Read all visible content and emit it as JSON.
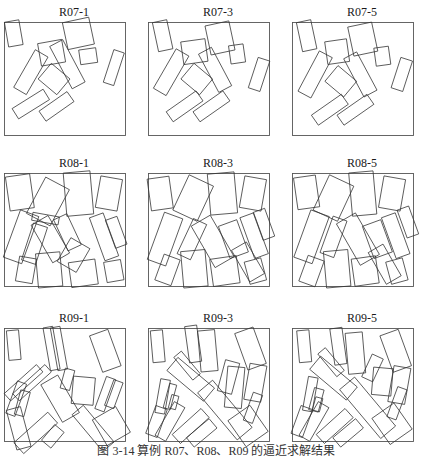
{
  "caption": "图 3-14   算例 R07、R08、R09 的逼近求解结果",
  "panels": [
    {
      "title": "R07-1",
      "pieces": [
        [
          0.08,
          0.1,
          0.12,
          0.22,
          -10
        ],
        [
          0.61,
          0.1,
          0.22,
          0.24,
          -12
        ],
        [
          0.39,
          0.27,
          0.2,
          0.2,
          -10
        ],
        [
          0.69,
          0.3,
          0.14,
          0.13,
          -8
        ],
        [
          0.52,
          0.37,
          0.12,
          0.42,
          -28
        ],
        [
          0.22,
          0.44,
          0.12,
          0.38,
          30
        ],
        [
          0.41,
          0.5,
          0.2,
          0.18,
          40
        ],
        [
          0.9,
          0.4,
          0.09,
          0.3,
          18
        ],
        [
          0.22,
          0.72,
          0.1,
          0.32,
          58
        ],
        [
          0.43,
          0.74,
          0.1,
          0.3,
          55
        ]
      ]
    },
    {
      "title": "R07-3",
      "pieces": [
        [
          0.12,
          0.12,
          0.12,
          0.26,
          -12
        ],
        [
          0.59,
          0.14,
          0.2,
          0.26,
          -12
        ],
        [
          0.38,
          0.26,
          0.2,
          0.2,
          -8
        ],
        [
          0.73,
          0.28,
          0.12,
          0.16,
          -8
        ],
        [
          0.19,
          0.44,
          0.12,
          0.4,
          30
        ],
        [
          0.55,
          0.42,
          0.12,
          0.38,
          -28
        ],
        [
          0.4,
          0.5,
          0.2,
          0.18,
          40
        ],
        [
          0.91,
          0.46,
          0.1,
          0.28,
          18
        ],
        [
          0.3,
          0.74,
          0.1,
          0.32,
          55
        ],
        [
          0.52,
          0.74,
          0.1,
          0.32,
          55
        ]
      ]
    },
    {
      "title": "R07-5",
      "pieces": [
        [
          0.12,
          0.12,
          0.12,
          0.26,
          -12
        ],
        [
          0.58,
          0.15,
          0.2,
          0.26,
          -12
        ],
        [
          0.37,
          0.26,
          0.18,
          0.2,
          -8
        ],
        [
          0.74,
          0.3,
          0.12,
          0.16,
          -8
        ],
        [
          0.19,
          0.46,
          0.12,
          0.4,
          28
        ],
        [
          0.56,
          0.46,
          0.12,
          0.38,
          -28
        ],
        [
          0.4,
          0.52,
          0.2,
          0.18,
          40
        ],
        [
          0.9,
          0.46,
          0.1,
          0.28,
          18
        ],
        [
          0.31,
          0.77,
          0.1,
          0.32,
          55
        ],
        [
          0.52,
          0.77,
          0.1,
          0.32,
          55
        ]
      ]
    },
    {
      "title": "R08-1",
      "pieces": [
        [
          0.13,
          0.17,
          0.2,
          0.3,
          -8
        ],
        [
          0.36,
          0.25,
          0.22,
          0.36,
          28
        ],
        [
          0.61,
          0.18,
          0.22,
          0.38,
          -5
        ],
        [
          0.86,
          0.18,
          0.18,
          0.28,
          10
        ],
        [
          0.14,
          0.56,
          0.16,
          0.44,
          20
        ],
        [
          0.25,
          0.62,
          0.12,
          0.34,
          18
        ],
        [
          0.38,
          0.58,
          0.16,
          0.38,
          -30
        ],
        [
          0.52,
          0.52,
          0.12,
          0.3,
          -25
        ],
        [
          0.57,
          0.72,
          0.18,
          0.24,
          30
        ],
        [
          0.82,
          0.56,
          0.12,
          0.4,
          -20
        ],
        [
          0.92,
          0.52,
          0.1,
          0.26,
          -20
        ],
        [
          0.18,
          0.85,
          0.14,
          0.22,
          10
        ],
        [
          0.37,
          0.85,
          0.2,
          0.3,
          -5
        ],
        [
          0.65,
          0.88,
          0.22,
          0.22,
          -8
        ],
        [
          0.9,
          0.86,
          0.14,
          0.18,
          -10
        ],
        [
          0.34,
          0.4,
          0.22,
          0.07,
          10
        ]
      ]
    },
    {
      "title": "R08-3",
      "pieces": [
        [
          0.1,
          0.18,
          0.18,
          0.28,
          -8
        ],
        [
          0.37,
          0.22,
          0.22,
          0.34,
          25
        ],
        [
          0.61,
          0.18,
          0.22,
          0.36,
          -5
        ],
        [
          0.86,
          0.18,
          0.18,
          0.28,
          10
        ],
        [
          0.14,
          0.58,
          0.16,
          0.44,
          20
        ],
        [
          0.36,
          0.58,
          0.12,
          0.34,
          25
        ],
        [
          0.53,
          0.6,
          0.18,
          0.42,
          -30
        ],
        [
          0.7,
          0.58,
          0.16,
          0.3,
          -20
        ],
        [
          0.87,
          0.55,
          0.12,
          0.38,
          -20
        ],
        [
          0.95,
          0.45,
          0.1,
          0.26,
          -20
        ],
        [
          0.16,
          0.85,
          0.14,
          0.24,
          20
        ],
        [
          0.38,
          0.84,
          0.2,
          0.32,
          -5
        ],
        [
          0.63,
          0.86,
          0.22,
          0.24,
          -8
        ],
        [
          0.88,
          0.86,
          0.14,
          0.2,
          -15
        ],
        [
          0.82,
          0.78,
          0.14,
          0.32,
          -30
        ]
      ]
    },
    {
      "title": "R08-5",
      "pieces": [
        [
          0.12,
          0.17,
          0.18,
          0.28,
          -8
        ],
        [
          0.34,
          0.22,
          0.22,
          0.34,
          25
        ],
        [
          0.58,
          0.18,
          0.2,
          0.38,
          -5
        ],
        [
          0.82,
          0.18,
          0.18,
          0.28,
          10
        ],
        [
          0.16,
          0.56,
          0.16,
          0.44,
          20
        ],
        [
          0.34,
          0.56,
          0.12,
          0.34,
          20
        ],
        [
          0.54,
          0.58,
          0.18,
          0.42,
          -30
        ],
        [
          0.7,
          0.58,
          0.16,
          0.3,
          -20
        ],
        [
          0.85,
          0.55,
          0.12,
          0.38,
          -20
        ],
        [
          0.95,
          0.43,
          0.1,
          0.26,
          -20
        ],
        [
          0.16,
          0.86,
          0.14,
          0.24,
          20
        ],
        [
          0.37,
          0.84,
          0.2,
          0.32,
          -5
        ],
        [
          0.6,
          0.86,
          0.2,
          0.24,
          -8
        ],
        [
          0.86,
          0.86,
          0.14,
          0.2,
          -15
        ],
        [
          0.76,
          0.8,
          0.14,
          0.32,
          -30
        ]
      ]
    },
    {
      "title": "R09-1",
      "pieces": [
        [
          0.08,
          0.15,
          0.1,
          0.26,
          -5
        ],
        [
          0.39,
          0.18,
          0.08,
          0.38,
          -10
        ],
        [
          0.45,
          0.18,
          0.08,
          0.38,
          -10
        ],
        [
          0.83,
          0.2,
          0.16,
          0.34,
          -20
        ],
        [
          0.16,
          0.48,
          0.08,
          0.38,
          48
        ],
        [
          0.23,
          0.48,
          0.08,
          0.38,
          48
        ],
        [
          0.1,
          0.62,
          0.08,
          0.3,
          20
        ],
        [
          0.15,
          0.66,
          0.08,
          0.22,
          15
        ],
        [
          0.52,
          0.45,
          0.08,
          0.18,
          15
        ],
        [
          0.65,
          0.55,
          0.18,
          0.24,
          5
        ],
        [
          0.46,
          0.62,
          0.16,
          0.38,
          -30
        ],
        [
          0.83,
          0.58,
          0.08,
          0.3,
          20
        ],
        [
          0.9,
          0.58,
          0.08,
          0.24,
          20
        ],
        [
          0.12,
          0.88,
          0.12,
          0.36,
          -15
        ],
        [
          0.26,
          0.92,
          0.12,
          0.4,
          48
        ],
        [
          0.73,
          0.88,
          0.12,
          0.42,
          -40
        ],
        [
          0.88,
          0.86,
          0.22,
          0.26,
          -30
        ],
        [
          0.4,
          0.95,
          0.1,
          0.18,
          40
        ]
      ]
    },
    {
      "title": "R09-3",
      "pieces": [
        [
          0.08,
          0.16,
          0.1,
          0.28,
          -5
        ],
        [
          0.37,
          0.14,
          0.1,
          0.32,
          -8
        ],
        [
          0.49,
          0.2,
          0.14,
          0.36,
          -5
        ],
        [
          0.84,
          0.18,
          0.16,
          0.34,
          -20
        ],
        [
          0.32,
          0.33,
          0.08,
          0.26,
          -40
        ],
        [
          0.35,
          0.45,
          0.14,
          0.42,
          -50
        ],
        [
          0.66,
          0.43,
          0.12,
          0.28,
          15
        ],
        [
          0.71,
          0.52,
          0.14,
          0.36,
          5
        ],
        [
          0.88,
          0.48,
          0.14,
          0.32,
          10
        ],
        [
          0.12,
          0.6,
          0.08,
          0.3,
          10
        ],
        [
          0.18,
          0.6,
          0.06,
          0.22,
          15
        ],
        [
          0.21,
          0.65,
          0.06,
          0.12,
          15
        ],
        [
          0.63,
          0.72,
          0.16,
          0.54,
          -40
        ],
        [
          0.86,
          0.7,
          0.08,
          0.26,
          20
        ],
        [
          0.07,
          0.82,
          0.1,
          0.26,
          20
        ],
        [
          0.18,
          0.82,
          0.1,
          0.34,
          30
        ],
        [
          0.35,
          0.86,
          0.1,
          0.34,
          48
        ],
        [
          0.44,
          0.92,
          0.1,
          0.26,
          50
        ],
        [
          0.82,
          0.86,
          0.22,
          0.28,
          -35
        ]
      ]
    },
    {
      "title": "R09-5",
      "pieces": [
        [
          0.1,
          0.16,
          0.1,
          0.28,
          -5
        ],
        [
          0.38,
          0.16,
          0.1,
          0.32,
          -8
        ],
        [
          0.52,
          0.22,
          0.14,
          0.36,
          -5
        ],
        [
          0.85,
          0.2,
          0.16,
          0.34,
          -20
        ],
        [
          0.32,
          0.3,
          0.08,
          0.26,
          -40
        ],
        [
          0.34,
          0.44,
          0.14,
          0.42,
          -50
        ],
        [
          0.66,
          0.35,
          0.1,
          0.22,
          25
        ],
        [
          0.74,
          0.47,
          0.16,
          0.24,
          5
        ],
        [
          0.88,
          0.5,
          0.14,
          0.32,
          10
        ],
        [
          0.15,
          0.58,
          0.08,
          0.3,
          10
        ],
        [
          0.2,
          0.63,
          0.08,
          0.2,
          15
        ],
        [
          0.21,
          0.67,
          0.06,
          0.12,
          15
        ],
        [
          0.62,
          0.7,
          0.16,
          0.56,
          -40
        ],
        [
          0.86,
          0.66,
          0.08,
          0.28,
          20
        ],
        [
          0.08,
          0.82,
          0.1,
          0.26,
          20
        ],
        [
          0.18,
          0.82,
          0.1,
          0.34,
          30
        ],
        [
          0.35,
          0.86,
          0.1,
          0.34,
          48
        ],
        [
          0.46,
          0.92,
          0.1,
          0.26,
          50
        ],
        [
          0.82,
          0.84,
          0.22,
          0.28,
          -35
        ]
      ]
    }
  ]
}
